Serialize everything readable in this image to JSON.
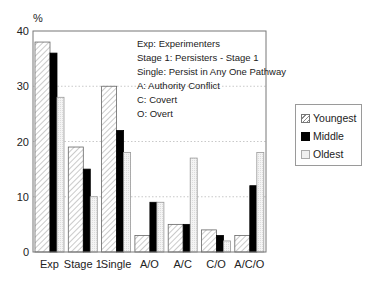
{
  "chart_data": {
    "type": "bar",
    "title": "",
    "ylabel": "%",
    "xlabel": "",
    "ylim": [
      0,
      40
    ],
    "yticks": [
      0,
      10,
      20,
      30,
      40
    ],
    "grid": "horizontal dotted",
    "legend_position": "right",
    "categories": [
      "Exp",
      "Stage 1",
      "Single",
      "A/O",
      "A/C",
      "C/O",
      "A/C/O"
    ],
    "series": [
      {
        "name": "Youngest",
        "pattern": "hatched",
        "color": "#ffffff",
        "values": [
          38,
          19,
          30,
          3,
          5,
          4,
          3
        ]
      },
      {
        "name": "Middle",
        "pattern": "solid",
        "color": "#000000",
        "values": [
          36,
          15,
          22,
          9,
          5,
          3,
          12
        ]
      },
      {
        "name": "Oldest",
        "pattern": "dotted-light",
        "color": "#eeeeee",
        "values": [
          28,
          10,
          18,
          9,
          17,
          2,
          18
        ]
      }
    ],
    "annotations": [
      "Exp: Experimenters",
      "Stage 1: Persisters - Stage 1",
      "Single: Persist in Any One Pathway",
      "A: Authority Conflict",
      "C: Covert",
      "O: Overt"
    ]
  },
  "legend": {
    "items": [
      {
        "label": "Youngest"
      },
      {
        "label": "Middle"
      },
      {
        "label": "Oldest"
      }
    ]
  }
}
